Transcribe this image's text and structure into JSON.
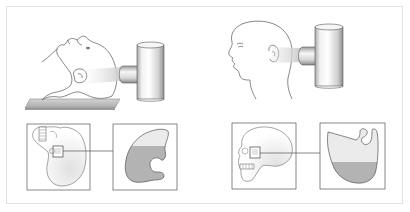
{
  "figure": {
    "type": "radiographic-positioning-diagram",
    "panels": [
      {
        "id": "left",
        "position": "supine, head tilted back, horizontal beam",
        "main_illustration": "supine-head-with-xray-tube",
        "inset_skull": "skull-rotated-view",
        "inset_sinus": "sinus-with-air-fluid-level",
        "fluid_fill_color": "#b3b3b3",
        "air_fill_color": "#ebebeb"
      },
      {
        "id": "right",
        "position": "upright lateral, horizontal beam",
        "main_illustration": "upright-profile-head-with-xray-tube",
        "inset_skull": "skull-lateral-view",
        "inset_sinus": "sinus-with-air-fluid-level",
        "fluid_fill_color": "#b3b3b3",
        "air_fill_color": "#ebebeb"
      }
    ]
  },
  "colors": {
    "frame_border": "#e2e2e2",
    "line": "#555555",
    "tube_light": "#f4f4f4",
    "tube_dark": "#9a9a9a",
    "beam": "#d8d8d8",
    "platform": "#bdbdbd"
  }
}
